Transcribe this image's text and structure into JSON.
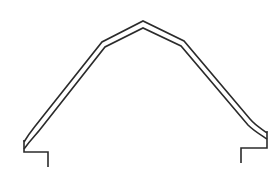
{
  "diagram": {
    "type": "line-drawing",
    "stroke_color": "#2b2b2b",
    "background": "#ffffff",
    "outer_path": "M24,142 C30,132 34,128 40,120 L102,42 L143,21 L184,41 L250,119 C256,126 262,129 267,133",
    "inner_path": "M24,149 C31,139 36,135 42,127 L105,47 L143,28 L181,46 L248,125 C254,131 261,135 267,139",
    "left_foot_path": "M24,140 L24,152 L48,152 L48,167",
    "right_foot_path": "M267,131 L267,148 L241,148 L241,163"
  }
}
